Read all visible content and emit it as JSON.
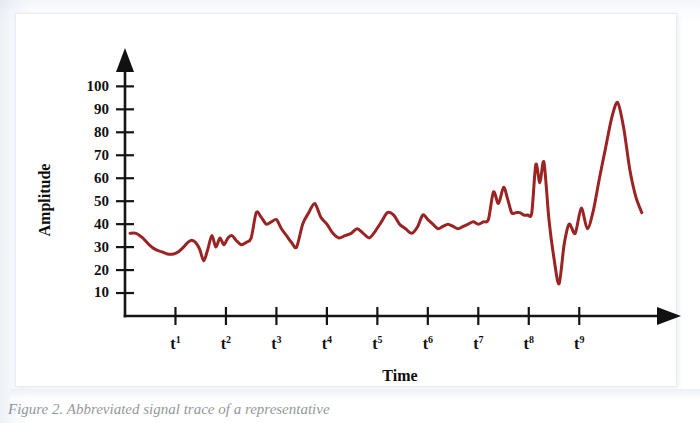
{
  "figure": {
    "caption": "Figure 2. Abbreviated signal trace of a representative",
    "background_color": "#ffffff",
    "plate_border_color": "#e7ecf3"
  },
  "chart_data": {
    "type": "line",
    "title": "",
    "subtitle": "",
    "xlabel": "Time",
    "ylabel": "Amplitude",
    "grid": false,
    "legend": false,
    "legend_position": "none",
    "series_color": "#9B2323",
    "axis_color": "#111111",
    "ylim": [
      0,
      108
    ],
    "yticks": [
      10,
      20,
      30,
      40,
      50,
      60,
      70,
      80,
      90,
      100
    ],
    "ytick_labels": [
      "10",
      "20",
      "30",
      "40",
      "50",
      "60",
      "70",
      "80",
      "90",
      "100"
    ],
    "xlim": [
      0,
      10.6
    ],
    "xticks": [
      1,
      2,
      3,
      4,
      5,
      6,
      7,
      8,
      9
    ],
    "xtick_labels": [
      "t1",
      "t2",
      "t3",
      "t4",
      "t5",
      "t6",
      "t7",
      "t8",
      "t9"
    ],
    "xtick_bases": [
      "t",
      "t",
      "t",
      "t",
      "t",
      "t",
      "t",
      "t",
      "t"
    ],
    "xtick_supers": [
      "1",
      "2",
      "3",
      "4",
      "5",
      "6",
      "7",
      "8",
      "9"
    ],
    "series": [
      {
        "name": "amplitude",
        "color": "#9B2323",
        "x": [
          0.1,
          0.22,
          0.35,
          0.48,
          0.6,
          0.72,
          0.84,
          0.96,
          1.06,
          1.16,
          1.24,
          1.32,
          1.4,
          1.48,
          1.56,
          1.64,
          1.72,
          1.8,
          1.88,
          1.96,
          2.04,
          2.12,
          2.2,
          2.3,
          2.4,
          2.5,
          2.6,
          2.7,
          2.8,
          2.9,
          3.0,
          3.1,
          3.2,
          3.3,
          3.4,
          3.52,
          3.64,
          3.76,
          3.88,
          4.0,
          4.12,
          4.24,
          4.36,
          4.48,
          4.6,
          4.72,
          4.84,
          4.96,
          5.08,
          5.2,
          5.32,
          5.44,
          5.56,
          5.68,
          5.8,
          5.9,
          6.0,
          6.1,
          6.2,
          6.3,
          6.4,
          6.5,
          6.6,
          6.7,
          6.8,
          6.9,
          7.0,
          7.1,
          7.2,
          7.3,
          7.4,
          7.5,
          7.58,
          7.66,
          7.74,
          7.82,
          7.9,
          7.98,
          8.06,
          8.14,
          8.22,
          8.3,
          8.4,
          8.5,
          8.6,
          8.7,
          8.8,
          8.92,
          9.04,
          9.16,
          9.28,
          9.4,
          9.52,
          9.64,
          9.76,
          9.88,
          10.0,
          10.12,
          10.24
        ],
        "y": [
          36,
          36,
          34,
          31,
          29,
          28,
          27,
          27,
          28,
          30,
          32,
          33,
          32,
          29,
          24,
          29,
          35,
          30,
          34,
          31,
          34,
          35,
          33,
          31,
          32,
          34,
          45,
          43,
          40,
          41,
          42,
          38,
          35,
          32,
          30,
          40,
          45,
          49,
          43,
          40,
          36,
          34,
          35,
          36,
          38,
          36,
          34,
          37,
          41,
          45,
          44,
          40,
          38,
          36,
          39,
          44,
          42,
          40,
          38,
          39,
          40,
          39,
          38,
          39,
          40,
          41,
          40,
          41,
          42,
          54,
          49,
          56,
          51,
          45,
          45,
          45,
          44,
          44,
          45,
          66,
          58,
          67,
          42,
          25,
          14,
          31,
          40,
          36,
          47,
          38,
          46,
          60,
          73,
          86,
          93,
          82,
          64,
          52,
          45
        ]
      }
    ],
    "annotations": [],
    "notable_points": {
      "global_max": {
        "x": 9.76,
        "y": 93
      },
      "global_min": {
        "x": 8.6,
        "y": 14
      },
      "start": {
        "x": 0.1,
        "y": 36
      },
      "end": {
        "x": 10.24,
        "y": 25
      }
    }
  },
  "icons": {
    "y_axis_arrow": "arrow-up-icon",
    "x_axis_arrow": "arrow-right-icon"
  }
}
